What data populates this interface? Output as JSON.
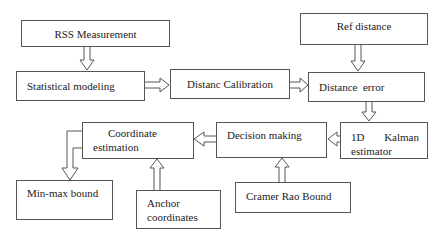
{
  "diagram": {
    "nodes": [
      {
        "id": "rss",
        "label": "RSS Measurement"
      },
      {
        "id": "stat",
        "label": "Statistical modeling"
      },
      {
        "id": "calib",
        "label": "Distanc Calibration"
      },
      {
        "id": "ref",
        "label": "Ref distance"
      },
      {
        "id": "err",
        "label": "Distance  error"
      },
      {
        "id": "kalman",
        "label_line1": "1D",
        "label_line1b": "Kalman",
        "label_line2": "estimator"
      },
      {
        "id": "decision",
        "label": "Decision making"
      },
      {
        "id": "coord",
        "label_line1": "Coordinate",
        "label_line2": "estimation"
      },
      {
        "id": "minmax",
        "label": "Min-max bound"
      },
      {
        "id": "anchor",
        "label_line1": "Anchor",
        "label_line2": "coordinates"
      },
      {
        "id": "crb",
        "label": "Cramer Rao Bound"
      }
    ],
    "edges": [
      {
        "from": "rss",
        "to": "stat"
      },
      {
        "from": "stat",
        "to": "calib"
      },
      {
        "from": "calib",
        "to": "err"
      },
      {
        "from": "ref",
        "to": "err"
      },
      {
        "from": "err",
        "to": "kalman"
      },
      {
        "from": "kalman",
        "to": "decision"
      },
      {
        "from": "crb",
        "to": "decision"
      },
      {
        "from": "decision",
        "to": "coord"
      },
      {
        "from": "anchor",
        "to": "coord"
      },
      {
        "from": "coord",
        "to": "minmax"
      }
    ]
  }
}
